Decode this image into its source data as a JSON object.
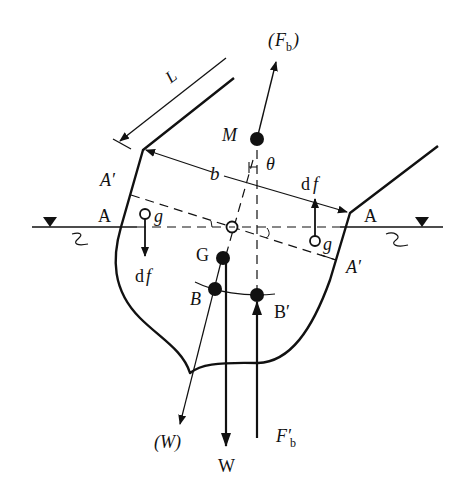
{
  "diagram": {
    "labels": {
      "L": "L",
      "b": "b",
      "M": "M",
      "theta": "θ",
      "Fb_paren_open": "(",
      "Fb_F": "F",
      "Fb_sub": "b",
      "Fb_paren_close": ")",
      "A_left": "A",
      "A_right": "A",
      "A_prime_left": "A′",
      "A_prime_right": "A′",
      "g_left": "g",
      "g_right": "g",
      "df_left_d": "d",
      "df_left_f": "f",
      "df_right_d": "d",
      "df_right_f": "f",
      "G": "G",
      "B": "B",
      "B_prime": "B′",
      "W_paren": "(W)",
      "W": "W",
      "Fb_prime_F": "F′",
      "Fb_prime_sub": "b"
    },
    "colors": {
      "stroke": "#111111",
      "background": "#ffffff"
    }
  }
}
